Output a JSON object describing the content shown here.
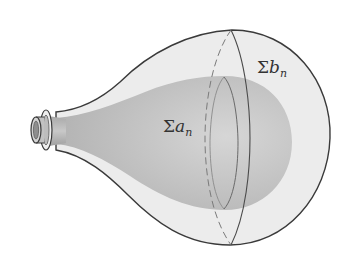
{
  "diagram": {
    "outer_balloon": {
      "label_symbol": "Σ",
      "label_var": "b",
      "label_sub": "n"
    },
    "inner_balloon": {
      "label_symbol": "Σ",
      "label_var": "a",
      "label_sub": "n"
    },
    "colors": {
      "background": "#ffffff",
      "outer_fill": "#ededed",
      "inner_fill": "#c4c4c4",
      "outline": "#3a3a3a",
      "text": "#333333"
    }
  }
}
